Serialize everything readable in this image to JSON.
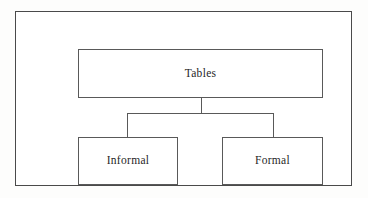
{
  "diagram": {
    "type": "hierarchy-tree",
    "colors": {
      "frame_border": "#4a4a4a",
      "node_border": "#595959",
      "connector": "#595959",
      "node_fill": "#ffffff",
      "canvas_background": "#fdfdfc",
      "text": "#1f1f1f"
    },
    "root": {
      "id": "tables",
      "label": "Tables"
    },
    "children": [
      {
        "id": "informal",
        "label": "Informal"
      },
      {
        "id": "formal",
        "label": "Formal"
      }
    ],
    "connectors": [
      {
        "id": "stem",
        "from": "tables",
        "to": "distribution-bar",
        "orientation": "vertical"
      },
      {
        "id": "bar",
        "from": "distribution-bar",
        "to": "distribution-bar",
        "orientation": "horizontal"
      },
      {
        "id": "drop-informal",
        "from": "distribution-bar",
        "to": "informal",
        "orientation": "vertical"
      },
      {
        "id": "drop-formal",
        "from": "distribution-bar",
        "to": "formal",
        "orientation": "vertical"
      }
    ]
  }
}
